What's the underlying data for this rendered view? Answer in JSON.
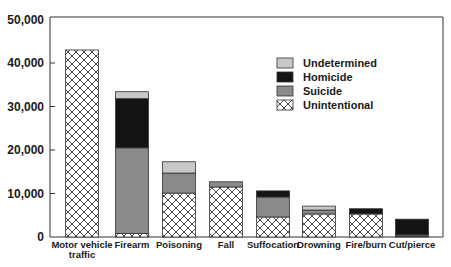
{
  "chart_data": {
    "type": "bar",
    "stacked": true,
    "title": "",
    "xlabel": "",
    "ylabel": "",
    "ylim": [
      0,
      50000
    ],
    "yticks": [
      0,
      10000,
      20000,
      30000,
      40000,
      50000
    ],
    "ytick_labels": [
      "0",
      "10,000",
      "20,000",
      "30,000",
      "40,000",
      "50,000"
    ],
    "grid": false,
    "legend_position": "upper right (inside)",
    "categories": [
      "Motor vehicle traffic",
      "Firearm",
      "Poisoning",
      "Fall",
      "Suffocation",
      "Drowning",
      "Fire/burn",
      "Cut/pierce"
    ],
    "category_lines": [
      [
        "Motor vehicle",
        "traffic"
      ],
      [
        "Firearm"
      ],
      [
        "Poisoning"
      ],
      [
        "Fall"
      ],
      [
        "Suffocation"
      ],
      [
        "Drowning"
      ],
      [
        "Fire/burn"
      ],
      [
        "Cut/pierce"
      ]
    ],
    "series": [
      {
        "name": "Unintentional",
        "pattern": "crosshatch",
        "color": "#ffffff",
        "values": [
          43000,
          800,
          10100,
          11500,
          4600,
          5300,
          5300,
          200
        ]
      },
      {
        "name": "Suicide",
        "color": "#8a8a8a",
        "values": [
          0,
          19700,
          4600,
          1200,
          4600,
          900,
          0,
          300
        ]
      },
      {
        "name": "Homicide",
        "color": "#141414",
        "values": [
          0,
          11300,
          0,
          0,
          1400,
          0,
          1200,
          3600
        ]
      },
      {
        "name": "Undetermined",
        "color": "#c8c8c8",
        "values": [
          0,
          1600,
          2600,
          0,
          0,
          900,
          0,
          0
        ]
      }
    ],
    "legend_order": [
      "Undetermined",
      "Homicide",
      "Suicide",
      "Unintentional"
    ]
  }
}
